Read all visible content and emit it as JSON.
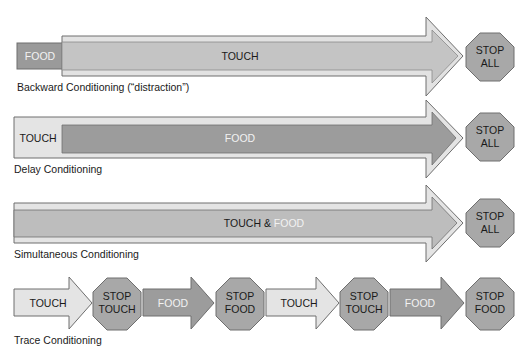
{
  "colors": {
    "light_fill": "#e4e4e4",
    "mid_fill": "#c6c6c6",
    "dark_fill": "#9a9a9a",
    "stop_fill": "#a8a8a8",
    "outline": "#6e6e6e",
    "text_dark": "#1a1a1a",
    "text_light": "#f2f2f2"
  },
  "rows": [
    {
      "caption": "Backward Conditioning (“distraction”)",
      "first_box_label": "FOOD",
      "arrow_label": "TOUCH",
      "stop_sign": [
        "STOP",
        "ALL"
      ]
    },
    {
      "caption": "Delay Conditioning",
      "outer_label": "TOUCH",
      "inner_label": "FOOD",
      "stop_sign": [
        "STOP",
        "ALL"
      ]
    },
    {
      "caption": "Simultaneous Conditioning",
      "arrow_label_part1": "TOUCH & ",
      "arrow_label_part2": "FOOD",
      "stop_sign": [
        "STOP",
        "ALL"
      ]
    },
    {
      "caption": "Trace Conditioning",
      "sequence": [
        {
          "type": "arrow",
          "label": "TOUCH",
          "style": "light"
        },
        {
          "type": "stop",
          "lines": [
            "STOP",
            "TOUCH"
          ]
        },
        {
          "type": "arrow",
          "label": "FOOD",
          "style": "dark"
        },
        {
          "type": "stop",
          "lines": [
            "STOP",
            "FOOD"
          ]
        },
        {
          "type": "arrow",
          "label": "TOUCH",
          "style": "light"
        },
        {
          "type": "stop",
          "lines": [
            "STOP",
            "TOUCH"
          ]
        },
        {
          "type": "arrow",
          "label": "FOOD",
          "style": "dark"
        },
        {
          "type": "stop",
          "lines": [
            "STOP",
            "FOOD"
          ]
        }
      ]
    }
  ]
}
